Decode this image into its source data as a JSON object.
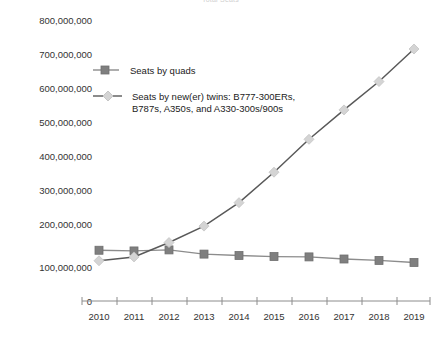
{
  "chart_data": {
    "type": "line",
    "title": "Total Seats",
    "xlabel": "",
    "ylabel": "",
    "categories": [
      "2010",
      "2011",
      "2012",
      "2013",
      "2014",
      "2015",
      "2016",
      "2017",
      "2018",
      "2019"
    ],
    "ylim": [
      0,
      800000000
    ],
    "ytick_labels": [
      "800,000,000",
      "700,000,000",
      "600,000,000",
      "500,000,000",
      "400,000,000",
      "300,000,000",
      "200,000,000",
      "100,000,000",
      "0"
    ],
    "ytick_values": [
      800000000,
      700000000,
      600000000,
      500000000,
      400000000,
      300000000,
      200000000,
      100000000,
      0
    ],
    "grid": false,
    "legend_position": "upper-left-inside",
    "series": [
      {
        "name": "Seats by quads",
        "marker": "square",
        "marker_color": "#7f7f7f",
        "line_color": "#8c8c8c",
        "values": [
          145000000,
          143000000,
          146000000,
          134000000,
          130000000,
          127000000,
          126000000,
          120000000,
          116000000,
          110000000
        ]
      },
      {
        "name": "Seats by new(er) twins: B777-300ERs, B787s, A350s, and A330-300s/900s",
        "name_line1": "Seats by new(er) twins: B777-300ERs,",
        "name_line2": "B787s, A350s, and A330-300s/900s",
        "marker": "diamond",
        "marker_color": "#d4d4d4",
        "line_color": "#595959",
        "values": [
          115000000,
          126000000,
          167000000,
          214000000,
          281000000,
          368000000,
          462000000,
          546000000,
          627000000,
          720000000
        ]
      }
    ]
  },
  "axis": {
    "x_axis_color": "#8c8c8c",
    "tick_color": "#8c8c8c"
  }
}
